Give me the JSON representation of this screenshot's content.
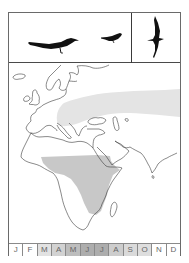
{
  "plate": {
    "frame_color": "#6a6a6a",
    "silhouettes": [
      {
        "name": "perched-adult",
        "icon": "bird-perched-large-icon"
      },
      {
        "name": "perched-small",
        "icon": "bird-perched-small-icon"
      },
      {
        "name": "flight",
        "icon": "bird-flight-icon"
      }
    ]
  },
  "map": {
    "region": "Europe, Africa and western Asia",
    "ranges": [
      {
        "name": "breeding-range",
        "area": "Central/Eastern Europe eastward across Asia",
        "color": "#e4e4e4"
      },
      {
        "name": "wintering-range",
        "area": "Sub-Saharan Africa (Sahel to East Africa)",
        "color": "#c8c8c8"
      }
    ],
    "coastline_color": "#3a3a3a"
  },
  "months": {
    "labels": [
      "J",
      "F",
      "M",
      "A",
      "M",
      "J",
      "J",
      "A",
      "S",
      "O",
      "N",
      "D"
    ],
    "shades": [
      "#ffffff",
      "#ffffff",
      "#e2e2e2",
      "#d2d2d2",
      "#bdbdbd",
      "#adadad",
      "#adadad",
      "#cdcdcd",
      "#dadada",
      "#dedede",
      "#ffffff",
      "#ffffff"
    ]
  }
}
